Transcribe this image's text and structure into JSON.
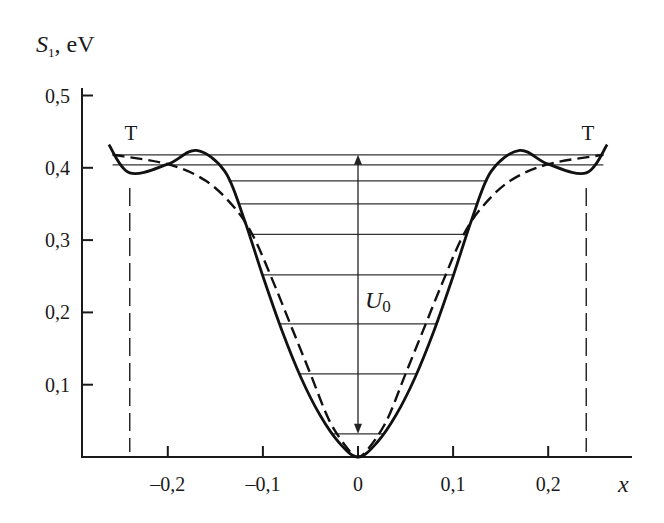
{
  "chart_data": {
    "type": "line",
    "title": "",
    "xlabel": "x",
    "ylabel": "S1, eV",
    "ylabel_main": "S",
    "ylabel_sub": "1",
    "ylabel_unit": ", eV",
    "xlim": [
      -0.27,
      0.27
    ],
    "ylim": [
      0,
      0.5
    ],
    "x_ticks": [
      "–0,2",
      "–0,1",
      "0",
      "0,1",
      "0,2"
    ],
    "x_tick_values": [
      -0.2,
      -0.1,
      0,
      0.1,
      0.2
    ],
    "y_ticks": [
      "0,1",
      "0,2",
      "0,3",
      "0,4",
      "0,5"
    ],
    "y_tick_values": [
      0.1,
      0.2,
      0.3,
      0.4,
      0.5
    ],
    "grid": false,
    "annotations": [
      {
        "text": "T",
        "x": -0.24,
        "y": 0.44,
        "note": "left turning point"
      },
      {
        "text": "T",
        "x": 0.24,
        "y": 0.44,
        "note": "right turning point"
      },
      {
        "text": "U0",
        "x": 0.0,
        "y": 0.22,
        "note": "well depth arrow from 0.03 to 0.42"
      }
    ],
    "vertical_dashed_lines_x": [
      -0.24,
      0.24
    ],
    "energy_levels": [
      0.032,
      0.115,
      0.184,
      0.252,
      0.308,
      0.35,
      0.382,
      0.404,
      0.418
    ],
    "series": [
      {
        "name": "solid potential",
        "style": "solid",
        "x": [
          -0.262,
          -0.24,
          -0.2,
          -0.17,
          -0.14,
          -0.12,
          -0.1,
          -0.08,
          -0.06,
          -0.04,
          -0.02,
          0,
          0.02,
          0.04,
          0.06,
          0.08,
          0.1,
          0.12,
          0.14,
          0.17,
          0.2,
          0.24,
          0.262
        ],
        "values": [
          0.432,
          0.393,
          0.405,
          0.424,
          0.395,
          0.33,
          0.25,
          0.175,
          0.11,
          0.058,
          0.02,
          0.0,
          0.02,
          0.058,
          0.11,
          0.175,
          0.25,
          0.33,
          0.395,
          0.424,
          0.405,
          0.393,
          0.432
        ]
      },
      {
        "name": "dashed approximation",
        "style": "dashed",
        "x": [
          -0.258,
          -0.2,
          -0.16,
          -0.13,
          -0.11,
          -0.09,
          -0.07,
          -0.05,
          -0.03,
          -0.01,
          0,
          0.01,
          0.03,
          0.05,
          0.07,
          0.09,
          0.11,
          0.13,
          0.16,
          0.2,
          0.258
        ],
        "values": [
          0.418,
          0.405,
          0.382,
          0.345,
          0.305,
          0.245,
          0.18,
          0.115,
          0.05,
          0.01,
          0.0,
          0.01,
          0.05,
          0.115,
          0.18,
          0.245,
          0.305,
          0.345,
          0.382,
          0.405,
          0.418
        ]
      }
    ]
  }
}
